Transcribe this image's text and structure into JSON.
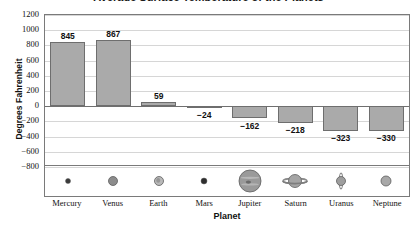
{
  "chart_data": {
    "type": "bar",
    "title": "Average Surface Temperature of the Planets",
    "xlabel": "Planet",
    "ylabel": "Degrees Fahrenheit",
    "categories": [
      "Mercury",
      "Venus",
      "Earth",
      "Mars",
      "Jupiter",
      "Saturn",
      "Uranus",
      "Neptune"
    ],
    "values": [
      845,
      867,
      59,
      -24,
      -162,
      -218,
      -323,
      -330
    ],
    "data_labels": [
      "845",
      "867",
      "59",
      "−24",
      "−162",
      "−218",
      "−323",
      "−330"
    ],
    "ylim": [
      -800,
      1200
    ],
    "ytick_step": 200,
    "ytick_labels": [
      "1200",
      "1000",
      "800",
      "600",
      "400",
      "200",
      "0",
      "−200",
      "−400",
      "−600",
      "−800"
    ],
    "grid": true,
    "legend": "none",
    "bar_color": "#aaaaaa",
    "bar_border_color": "#6e6e6e",
    "gridline_color": "#d6d6d6",
    "zero_line_color": "#6f6f6f",
    "frame_color": "#7a7a7a",
    "planet_icons": [
      {
        "name": "mercury-planet-icon",
        "size": 5,
        "color": "#3a3a3a",
        "rings": "none"
      },
      {
        "name": "venus-planet-icon",
        "size": 9,
        "color": "#8c8c8c",
        "rings": "none"
      },
      {
        "name": "earth-planet-icon",
        "size": 9,
        "color": "#b9b9b9",
        "rings": "none"
      },
      {
        "name": "mars-planet-icon",
        "size": 6,
        "color": "#2e2e2e",
        "rings": "none"
      },
      {
        "name": "jupiter-planet-icon",
        "size": 22,
        "color": "#9a9a9a",
        "rings": "none"
      },
      {
        "name": "saturn-planet-icon",
        "size": 13,
        "color": "#a5a5a5",
        "rings": "horizontal"
      },
      {
        "name": "uranus-planet-icon",
        "size": 9,
        "color": "#9e9e9e",
        "rings": "vertical"
      },
      {
        "name": "neptune-planet-icon",
        "size": 10,
        "color": "#a8a8a8",
        "rings": "none"
      }
    ]
  }
}
